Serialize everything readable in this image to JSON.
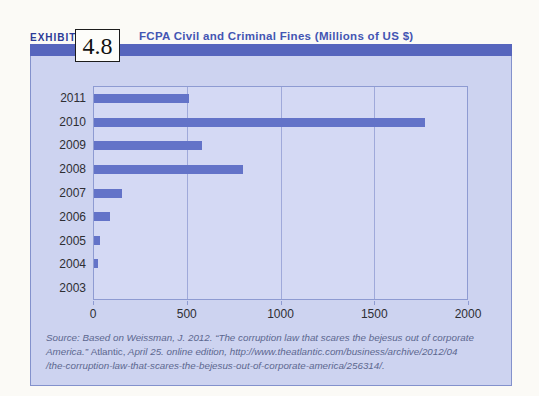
{
  "exhibit": {
    "label": "EXHIBIT",
    "number": "4.8",
    "title": "FCPA Civil and Criminal Fines (Millions of US $)"
  },
  "source": {
    "line1": "Source: Based on Weissman, J. 2012. “The corruption law that scares the bejesus out of corporate",
    "line2_pre": "America.” ",
    "line2_atlantic": "Atlantic,",
    "line2_post": " April 25. online edition, http://www.theatlantic.com/business/archive/2012/04",
    "line3": "/the-corruption-law-that-scares-the-bejesus-out-of-corporate-america/256314/."
  },
  "colors": {
    "header_band": "#5665bd",
    "panel_background": "#cdd3f0",
    "plot_background": "#d4d9f4",
    "bar": "#6373c8",
    "gridline": "#9fa9da",
    "title_text": "#4355b3",
    "exhibit_label_text": "#2c3a96",
    "axis_text": "#2e2e33",
    "source_text": "#5c678f"
  },
  "chart_data": {
    "type": "bar",
    "orientation": "horizontal",
    "title": "FCPA Civil and Criminal Fines (Millions of US $)",
    "xlabel": "",
    "ylabel": "",
    "categories": [
      "2011",
      "2010",
      "2009",
      "2008",
      "2007",
      "2006",
      "2005",
      "2004",
      "2003"
    ],
    "values": [
      510,
      1775,
      580,
      800,
      150,
      85,
      30,
      20,
      0
    ],
    "xlim": [
      0,
      2000
    ],
    "xticks": [
      0,
      500,
      1000,
      1500,
      2000
    ],
    "gridlines": [
      500,
      1000,
      1500
    ],
    "grid": "vertical gridlines at 500, 1000, 1500; plot border closes at 2000",
    "legend": "none",
    "note": "2003 bar not visible (approximately 0)"
  }
}
